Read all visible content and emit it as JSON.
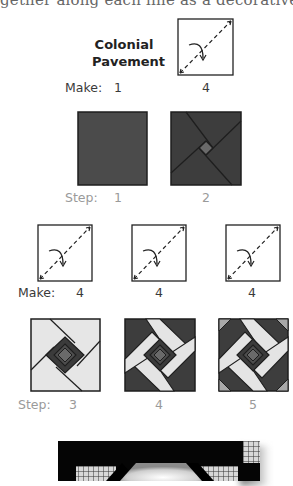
{
  "page": {
    "clipped_header_text": "gether along each line as a decorative accent."
  },
  "block": {
    "title_line1": "Colonial",
    "title_line2": "Pavement"
  },
  "row1": {
    "make_label": "Make:",
    "make_counts": [
      "1",
      "4"
    ],
    "step_label": "Step:",
    "steps": [
      "1",
      "2"
    ]
  },
  "row2": {
    "make_label": "Make:",
    "make_counts": [
      "4",
      "4",
      "4"
    ],
    "step_label": "Step:",
    "steps": [
      "3",
      "4",
      "5"
    ]
  },
  "icons": {
    "fold_diagram": "fold-diagonal-icon"
  },
  "colors": {
    "dark_fabric": "#4a4a4a",
    "darker_fabric": "#3b3b3b",
    "center_square": "#6a6a6a",
    "light_fabric": "#e6e6e6",
    "medium_corner": "#a9a9a9",
    "outline": "#1e1e1e",
    "step_label_grey": "#9a9a9a"
  }
}
